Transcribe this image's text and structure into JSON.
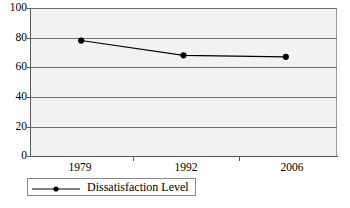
{
  "chart_data": {
    "type": "line",
    "title": "",
    "xlabel": "",
    "ylabel": "",
    "categories": [
      "1979",
      "1992",
      "2006"
    ],
    "series": [
      {
        "name": "Dissatisfaction Level",
        "values": [
          78,
          68,
          67
        ],
        "marker": "filled-circle",
        "color": "#000000"
      }
    ],
    "ylim": [
      0,
      100
    ],
    "yticks": [
      0,
      20,
      40,
      60,
      80,
      100
    ],
    "ytick_labels": [
      "0",
      "20",
      "40",
      "60",
      "80",
      "100"
    ],
    "xtick_labels": [
      "1979",
      "1992",
      "2006"
    ],
    "grid": "horizontal",
    "legend_position": "bottom-left",
    "plot_background": "#f2f2f2",
    "gridline_color": "#6d6d6d",
    "axis_color": "#5a5a5a"
  },
  "legend": {
    "entries": [
      {
        "label": "Dissatisfaction Level"
      }
    ]
  },
  "caption": {
    "text": ""
  }
}
